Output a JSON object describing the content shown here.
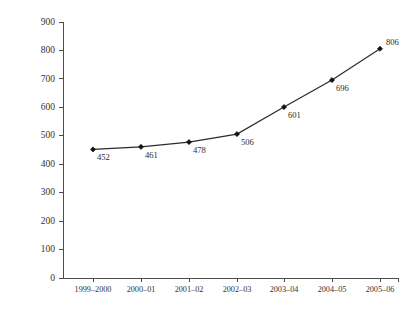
{
  "chart_data": {
    "type": "line",
    "title": "",
    "subtitle": "",
    "xlabel": "",
    "ylabel": "",
    "categories": [
      "1999–2000",
      "2000–01",
      "2001–02",
      "2002–03",
      "2003–04",
      "2004–05",
      "2005–06"
    ],
    "values": [
      452,
      461,
      478,
      506,
      601,
      696,
      806
    ],
    "point_labels": [
      "452",
      "461",
      "478",
      "506",
      "601",
      "696",
      "806"
    ],
    "ylim": [
      0,
      900
    ],
    "ytick_values": [
      0,
      100,
      200,
      300,
      400,
      500,
      600,
      700,
      800,
      900
    ],
    "ytick_labels": [
      "0",
      "100",
      "200",
      "300",
      "400",
      "500",
      "600",
      "700",
      "800",
      "900"
    ],
    "grid": false,
    "legend": false,
    "legend_position": "none",
    "marker": "diamond",
    "series": [
      {
        "name": "",
        "values": [
          452,
          461,
          478,
          506,
          601,
          696,
          806
        ]
      }
    ],
    "label_offsets": [
      {
        "dx": 4,
        "dy": 11
      },
      {
        "dx": 4,
        "dy": 11
      },
      {
        "dx": 4,
        "dy": 11
      },
      {
        "dx": 4,
        "dy": 11
      },
      {
        "dx": 4,
        "dy": 11
      },
      {
        "dx": 4,
        "dy": 11
      },
      {
        "dx": 6,
        "dy": -4
      }
    ],
    "colors": {
      "line": "#2b2b2b",
      "marker": "#121212",
      "axis": "#4d4d4d",
      "text": "#333333",
      "background": "#ffffff"
    }
  },
  "plot_geometry": {
    "x_axis_y": 278,
    "y_axis_x": 63,
    "y_axis_top": 22,
    "x_positions": [
      93,
      141,
      189,
      237,
      284,
      332,
      380
    ],
    "y_pixels_per_100": 28.45
  }
}
